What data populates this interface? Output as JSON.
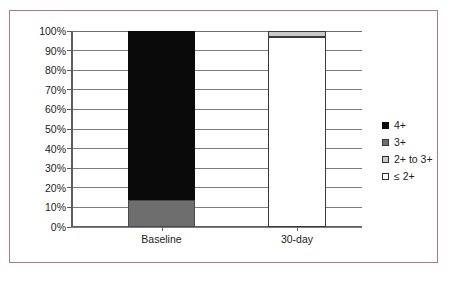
{
  "figure": {
    "border_color": "#b07b74",
    "background_color": "#ffffff",
    "caption_partial": ""
  },
  "legend": {
    "position": "right",
    "entries": [
      {
        "label": "4+",
        "color": "#0a0a0a",
        "swatch": "swatch-4plus"
      },
      {
        "label": "3+",
        "color": "#6e6e6e",
        "swatch": "swatch-3plus"
      },
      {
        "label": "2+ to 3+",
        "color": "#c9c9c9",
        "swatch": "swatch-2to3"
      },
      {
        "label": "≤ 2+",
        "color": "#ffffff",
        "swatch": "swatch-le2"
      }
    ]
  },
  "axis": {
    "y_ticks": [
      "100%",
      "90%",
      "80%",
      "70%",
      "60%",
      "50%",
      "40%",
      "30%",
      "20%",
      "10%",
      "0%"
    ],
    "x_categories": [
      "Baseline",
      "30-day"
    ]
  },
  "chart_data": {
    "type": "bar",
    "subtype": "stacked-100-percent",
    "title": "",
    "subtitle": "",
    "xlabel": "",
    "ylabel": "",
    "ylim": [
      0,
      100
    ],
    "ytick_values": [
      0,
      10,
      20,
      30,
      40,
      50,
      60,
      70,
      80,
      90,
      100
    ],
    "ytick_labels": [
      "0%",
      "10%",
      "20%",
      "30%",
      "40%",
      "50%",
      "60%",
      "70%",
      "80%",
      "90%",
      "100%"
    ],
    "grid": true,
    "grid_axis": "y",
    "legend_position": "right",
    "categories": [
      "Baseline",
      "30-day"
    ],
    "series": [
      {
        "name": "4+",
        "color": "#0a0a0a",
        "values": [
          86,
          0
        ]
      },
      {
        "name": "3+",
        "color": "#6e6e6e",
        "values": [
          14,
          0
        ]
      },
      {
        "name": "2+ to 3+",
        "color": "#c9c9c9",
        "values": [
          0,
          3
        ]
      },
      {
        "name": "≤ 2+",
        "color": "#ffffff",
        "values": [
          0,
          97
        ]
      }
    ],
    "stack_order_bottom_to_top": [
      "≤ 2+",
      "2+ to 3+",
      "3+",
      "4+"
    ]
  }
}
